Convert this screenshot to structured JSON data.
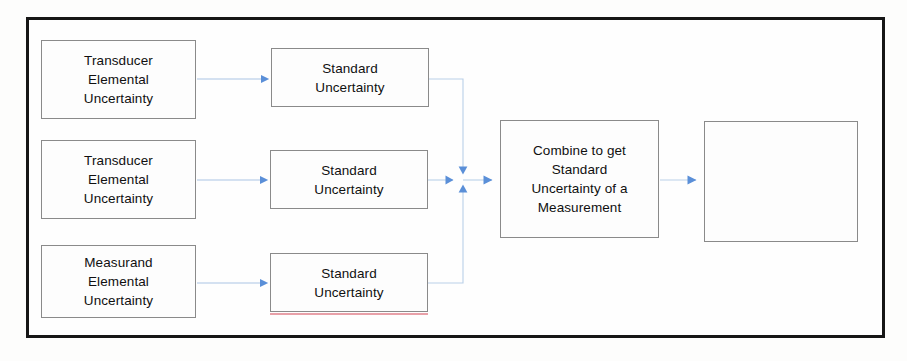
{
  "diagram": {
    "frame": {
      "border_color": "#161616"
    },
    "colors": {
      "box_border": "#8a8a8a",
      "box_fill": "#fdfdfd",
      "text": "#101010",
      "arrow": "#5a8fd8",
      "connector_line": "#b9cfe8",
      "red_underline": "#e8a0a8",
      "outer_frame": "#161616"
    },
    "nodes": [
      {
        "id": "transducer-elemental-uncertainty-1",
        "label": "Transducer\nElemental\nUncertainty",
        "x": 41,
        "y": 40,
        "w": 155,
        "h": 79,
        "column": "source",
        "row": 1
      },
      {
        "id": "transducer-elemental-uncertainty-2",
        "label": "Transducer\nElemental\nUncertainty",
        "x": 41,
        "y": 140,
        "w": 155,
        "h": 79,
        "column": "source",
        "row": 2
      },
      {
        "id": "measurand-elemental-uncertainty",
        "label": "Measurand\nElemental\nUncertainty",
        "x": 41,
        "y": 245,
        "w": 155,
        "h": 73,
        "column": "source",
        "row": 3
      },
      {
        "id": "standard-uncertainty-1",
        "label": "Standard\nUncertainty",
        "x": 271,
        "y": 48,
        "w": 158,
        "h": 59,
        "column": "standard",
        "row": 1
      },
      {
        "id": "standard-uncertainty-2",
        "label": "Standard\nUncertainty",
        "x": 270,
        "y": 150,
        "w": 158,
        "h": 59,
        "column": "standard",
        "row": 2
      },
      {
        "id": "standard-uncertainty-3",
        "label": "Standard\nUncertainty",
        "x": 270,
        "y": 253,
        "w": 158,
        "h": 59,
        "column": "standard",
        "row": 3,
        "has_red_underline": true
      },
      {
        "id": "combine-to-get-standard-uncertainty",
        "label": "Combine to get\nStandard\nUncertainty of a\nMeasurement",
        "x": 500,
        "y": 120,
        "w": 159,
        "h": 118,
        "column": "combine",
        "row": 2
      },
      {
        "id": "result-box-empty",
        "label": "",
        "x": 704,
        "y": 121,
        "w": 154,
        "h": 121,
        "column": "result",
        "row": 2,
        "empty": true
      }
    ],
    "connectors": [
      {
        "id": "arrow-source1-to-standard1",
        "from": "transducer-elemental-uncertainty-1",
        "to": "standard-uncertainty-1",
        "style": "straight-right"
      },
      {
        "id": "arrow-source2-to-standard2",
        "from": "transducer-elemental-uncertainty-2",
        "to": "standard-uncertainty-2",
        "style": "straight-right"
      },
      {
        "id": "arrow-source3-to-standard3",
        "from": "measurand-elemental-uncertainty",
        "to": "standard-uncertainty-3",
        "style": "straight-right"
      },
      {
        "id": "connector-standard1-to-junction",
        "from": "standard-uncertainty-1",
        "to": "junction",
        "style": "elbow-down"
      },
      {
        "id": "connector-standard2-to-junction",
        "from": "standard-uncertainty-2",
        "to": "junction",
        "style": "straight-right"
      },
      {
        "id": "connector-standard3-to-junction",
        "from": "measurand-standard-uncertainty-3",
        "to": "junction",
        "style": "elbow-up"
      },
      {
        "id": "arrow-junction-to-combine",
        "from": "junction",
        "to": "combine-to-get-standard-uncertainty",
        "style": "straight-right"
      },
      {
        "id": "arrow-combine-to-result",
        "from": "combine-to-get-standard-uncertainty",
        "to": "result-box-empty",
        "style": "straight-right"
      }
    ],
    "junction": {
      "x": 463,
      "y": 179
    }
  }
}
